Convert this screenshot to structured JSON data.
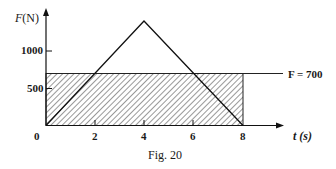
{
  "figure": {
    "caption": "Fig. 20",
    "y_axis_label": "F(N)",
    "x_axis_label": "t (s)",
    "y_ticks": [
      "1000",
      "500"
    ],
    "x_ticks": [
      "0",
      "2",
      "4",
      "6",
      "8"
    ],
    "reference_line_label": "F = 700"
  },
  "chart_data": {
    "type": "line",
    "title": "Fig. 20",
    "xlabel": "t (s)",
    "ylabel": "F(N)",
    "xlim": [
      0,
      8
    ],
    "ylim": [
      0,
      1500
    ],
    "x_ticks": [
      0,
      2,
      4,
      6,
      8
    ],
    "y_ticks": [
      500,
      1000
    ],
    "grid": false,
    "series": [
      {
        "name": "F(t) triangular pulse",
        "x": [
          0,
          4,
          8
        ],
        "y": [
          0,
          1400,
          0
        ]
      },
      {
        "name": "F = 700 (average force)",
        "x": [
          0,
          8
        ],
        "y": [
          700,
          700
        ]
      }
    ],
    "annotations": [
      {
        "text": "F = 700",
        "x": 8,
        "y": 700
      },
      {
        "text": "hatched rectangle 0 ≤ t ≤ 8, 0 ≤ F ≤ 700 (equal-area impulse)"
      }
    ]
  }
}
